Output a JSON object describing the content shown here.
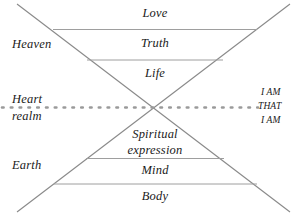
{
  "diagram": {
    "background_color": "#ffffff",
    "line_color": "#8a8a8a",
    "dotted_line_color": "#9a9a9a",
    "text_color": "#1a1a1a",
    "center_labels": [
      {
        "name": "love",
        "text": "Love"
      },
      {
        "name": "truth",
        "text": "Truth"
      },
      {
        "name": "life",
        "text": "Life"
      },
      {
        "name": "spiritual-expression-line1",
        "text": "Spiritual"
      },
      {
        "name": "spiritual-expression-line2",
        "text": "expression"
      },
      {
        "name": "mind",
        "text": "Mind"
      },
      {
        "name": "body",
        "text": "Body"
      }
    ],
    "left_labels": [
      {
        "name": "heaven",
        "text": "Heaven"
      },
      {
        "name": "heart-realm-line1",
        "text": "Heart"
      },
      {
        "name": "heart-realm-line2",
        "text": "realm"
      },
      {
        "name": "earth",
        "text": "Earth"
      }
    ],
    "right_labels": [
      {
        "name": "i-am-upper",
        "text": "I AM"
      },
      {
        "name": "that",
        "text": "THAT"
      },
      {
        "name": "i-am-lower",
        "text": "I AM"
      }
    ]
  }
}
